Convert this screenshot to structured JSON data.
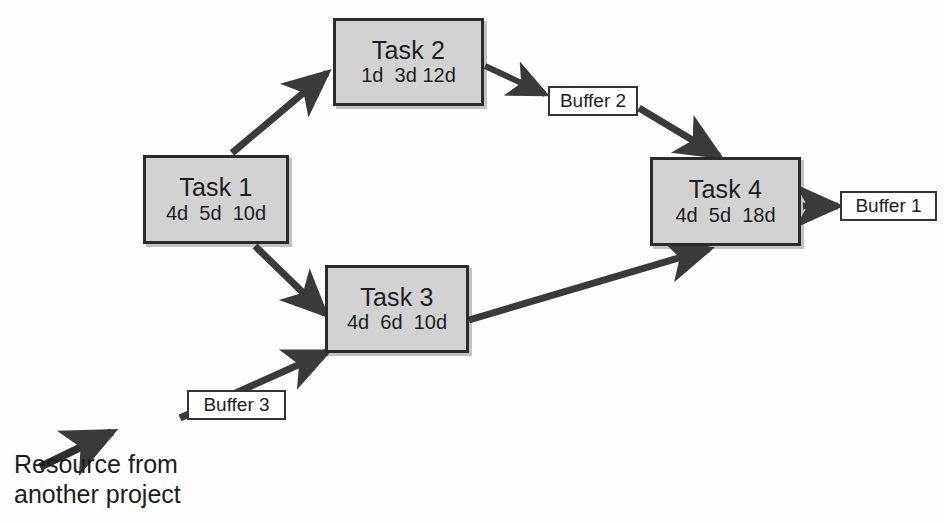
{
  "diagram": {
    "type": "node-link-network",
    "stroke_color": "#3a3a3a",
    "node_fill_color": "#d2d2d2",
    "node_border_color": "#2b2b2b",
    "buffer_fill_color": "#ffffff",
    "buffer_border_color": "#343434"
  },
  "nodes": [
    {
      "id": "task1",
      "title": "Task 1",
      "durations": "4d  5d  10d",
      "x": 143,
      "y": 155,
      "w": 146,
      "h": 89
    },
    {
      "id": "task2",
      "title": "Task 2",
      "durations": "1d  3d 12d",
      "x": 333,
      "y": 18,
      "w": 151,
      "h": 88
    },
    {
      "id": "task3",
      "title": "Task 3",
      "durations": "4d  6d  10d",
      "x": 325,
      "y": 265,
      "w": 144,
      "h": 88
    },
    {
      "id": "task4",
      "title": "Task 4",
      "durations": "4d  5d  18d",
      "x": 650,
      "y": 157,
      "w": 151,
      "h": 89
    }
  ],
  "buffers": [
    {
      "id": "buffer1",
      "label": "Buffer 1",
      "x": 840,
      "y": 191,
      "w": 97,
      "h": 30
    },
    {
      "id": "buffer2",
      "label": "Buffer 2",
      "x": 548,
      "y": 86,
      "w": 90,
      "h": 30
    },
    {
      "id": "buffer3",
      "label": "Buffer 3",
      "x": 187,
      "y": 390,
      "w": 99,
      "h": 30
    }
  ],
  "edges": [
    {
      "id": "task1-to-task2",
      "from": "task1",
      "to": "task2",
      "arrow": true
    },
    {
      "id": "task1-to-task3",
      "from": "task1",
      "to": "task3",
      "arrow": true
    },
    {
      "id": "task2-to-buffer2",
      "from": "task2",
      "to": "buffer2",
      "arrow": true
    },
    {
      "id": "buffer2-to-task4",
      "from": "buffer2",
      "to": "task4",
      "arrow": true
    },
    {
      "id": "task3-to-task4",
      "from": "task3",
      "to": "task4",
      "arrow": true
    },
    {
      "id": "task4-to-buffer1",
      "from": "task4",
      "to": "buffer1",
      "arrow": true
    },
    {
      "id": "resource-to-task3",
      "from": "resource",
      "to": "task3",
      "arrow": true
    },
    {
      "id": "resource-inflow",
      "from": "resource-label",
      "to": "resource",
      "arrow": true
    }
  ],
  "annotations": {
    "resource_caption": "Resource from\nanother project"
  }
}
